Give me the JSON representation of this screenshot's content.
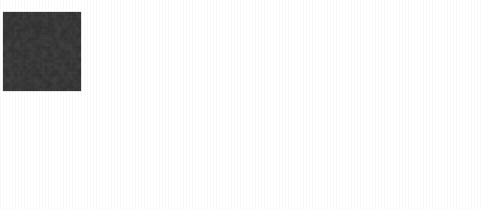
{
  "figure": {
    "background_color": "#ffffff",
    "panel_background_color": "#3b3b3b",
    "stroke_color": "#f2f2f2",
    "title_color": "#3a3a3a",
    "rows": 2,
    "columns": 4,
    "panel_width": 78,
    "panel_height": 79
  },
  "chart_data": {
    "type": "heatmap",
    "title": "",
    "xlabel": "",
    "ylabel": "",
    "grid": {
      "rows": 2,
      "cols": 4
    },
    "row_labels": [
      "clean",
      "noisy"
    ],
    "categories": [
      "2",
      "9",
      "3",
      "7"
    ],
    "values": [
      2,
      9,
      3,
      7
    ],
    "panels": [
      {
        "id": "panel-clean-2",
        "row": 0,
        "col": 0,
        "title": "2",
        "label": "2",
        "noise": false,
        "noise_density": 0.0,
        "x": 3,
        "y": 12,
        "width": 78,
        "height": 79
      },
      {
        "id": "panel-clean-9",
        "row": 0,
        "col": 1,
        "title": "9",
        "label": "9",
        "noise": false,
        "noise_density": 0.0,
        "x": 134,
        "y": 12,
        "width": 78,
        "height": 79
      },
      {
        "id": "panel-clean-3",
        "row": 0,
        "col": 2,
        "title": "3",
        "label": "3",
        "noise": false,
        "noise_density": 0.0,
        "x": 269,
        "y": 12,
        "width": 78,
        "height": 79
      },
      {
        "id": "panel-clean-7",
        "row": 0,
        "col": 3,
        "title": "7",
        "label": "7",
        "noise": false,
        "noise_density": 0.0,
        "x": 404,
        "y": 12,
        "width": 78,
        "height": 79
      },
      {
        "id": "panel-noisy-2",
        "row": 1,
        "col": 0,
        "title": "2",
        "label": "2",
        "noise": true,
        "noise_density": 0.035,
        "x": 3,
        "y": 124,
        "width": 78,
        "height": 79
      },
      {
        "id": "panel-noisy-9",
        "row": 1,
        "col": 1,
        "title": "9",
        "label": "9",
        "noise": true,
        "noise_density": 0.035,
        "x": 134,
        "y": 124,
        "width": 78,
        "height": 79
      },
      {
        "id": "panel-noisy-3",
        "row": 1,
        "col": 2,
        "title": "3",
        "label": "3",
        "noise": true,
        "noise_density": 0.035,
        "x": 269,
        "y": 124,
        "width": 78,
        "height": 79
      },
      {
        "id": "panel-noisy-7",
        "row": 1,
        "col": 3,
        "title": "7",
        "label": "7",
        "noise": true,
        "noise_density": 0.035,
        "x": 404,
        "y": 124,
        "width": 78,
        "height": 79
      }
    ]
  }
}
